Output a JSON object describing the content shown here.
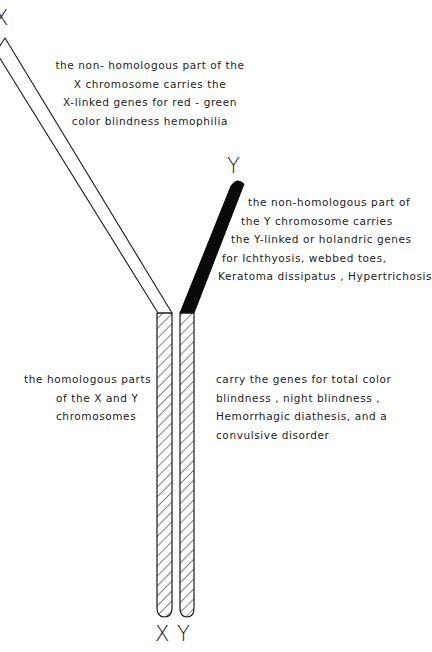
{
  "diagram": {
    "title_labels": {
      "x_top": "X",
      "y_top": "Y",
      "x_bottom": "X",
      "y_bottom": "Y"
    },
    "annotations": {
      "x_nonhomologous": [
        "the  non- homologous  part  of the",
        "X   chromosome   carries the",
        "X-linked genes for  red - green",
        "color blindness   hemophilia"
      ],
      "y_nonhomologous": [
        "the  non-homologous  part of",
        "the  Y chromosome   carries",
        "the   Y-linked  or  holandric genes",
        "for   Ichthyosis, webbed toes,",
        "Keratoma  dissipatus , Hypertrichosis"
      ],
      "homologous_left": [
        "the   homologous  parts",
        "of  the  X  and  Y",
        "chromosomes"
      ],
      "homologous_right": [
        "carry  the  genes  for  total  color",
        "blindness , night  blindness ,",
        "Hemorrhagic  diathesis,  and  a",
        "convulsive   disorder"
      ]
    },
    "colors": {
      "stroke": "#1a1a1a",
      "y_arm_fill": "#0a0a0a",
      "background": "#ffffff"
    }
  }
}
